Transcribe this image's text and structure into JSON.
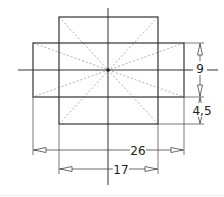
{
  "drawing": {
    "type": "technical-drawing",
    "description": "Two overlapping rectangles with center lines, diagonals and dimensions",
    "colors": {
      "outline": "#333333",
      "hidden": "#aaaaaa",
      "dim": "#444444",
      "text": "#222222"
    },
    "dimensions": {
      "height_upper": "9",
      "height_lower": "4,5",
      "width_outer": "26",
      "width_inner": "17"
    }
  }
}
